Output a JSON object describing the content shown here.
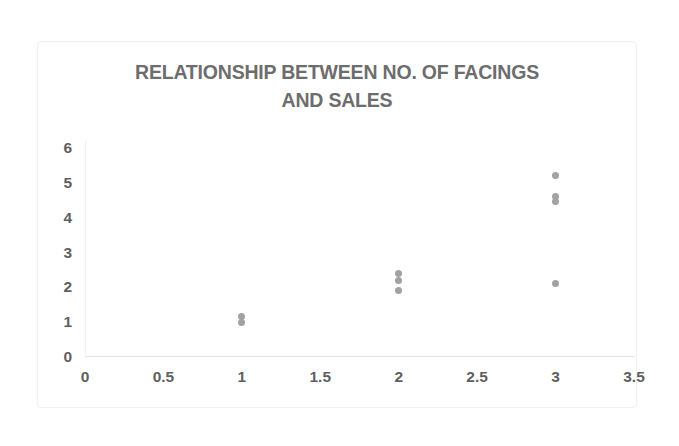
{
  "chart_data": {
    "type": "scatter",
    "title": "RELATIONSHIP BETWEEN NO. OF FACINGS AND SALES",
    "title_lines": [
      "RELATIONSHIP BETWEEN NO. OF FACINGS",
      "AND SALES"
    ],
    "xlabel": "",
    "ylabel": "",
    "xlim": [
      0,
      3.5
    ],
    "ylim": [
      0,
      6
    ],
    "xticks": [
      "0",
      "0.5",
      "1",
      "1.5",
      "2",
      "2.5",
      "3",
      "3.5"
    ],
    "xtick_values": [
      0,
      0.5,
      1,
      1.5,
      2,
      2.5,
      3,
      3.5
    ],
    "yticks": [
      "0",
      "1",
      "2",
      "3",
      "4",
      "5",
      "6"
    ],
    "ytick_values": [
      0,
      1,
      2,
      3,
      4,
      5,
      6
    ],
    "grid": false,
    "legend": false,
    "legend_position": "none",
    "series": [
      {
        "name": "Sales vs Facings",
        "marker": "circle",
        "color": "#a2a2a2",
        "points": [
          {
            "x": 1,
            "y": 1.15
          },
          {
            "x": 1,
            "y": 1.0
          },
          {
            "x": 2,
            "y": 2.4
          },
          {
            "x": 2,
            "y": 2.2
          },
          {
            "x": 2,
            "y": 1.9
          },
          {
            "x": 3,
            "y": 5.2
          },
          {
            "x": 3,
            "y": 4.6
          },
          {
            "x": 3,
            "y": 4.45
          },
          {
            "x": 3,
            "y": 2.1
          }
        ]
      }
    ]
  },
  "style": {
    "background": "#ffffff",
    "title_color": "#6d6d6d",
    "tick_color": "#5f5f5f",
    "marker_color": "#a2a2a2",
    "frame_color": "#f0f0f0",
    "axis_color": "#e2e2e2"
  }
}
